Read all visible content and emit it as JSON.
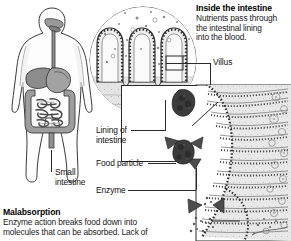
{
  "figure": {
    "width": 291,
    "height": 241,
    "background": "#ffffff",
    "ink_color": "#2a2a2a",
    "organ_fill": "#9a9a9a",
    "particle_fill": "#3a3a3a",
    "enzyme_fill": "#555555",
    "tissue_fill": "#cfcfcf"
  },
  "headings": {
    "inside_intestine": "Inside the intestine",
    "malabsorption": "Malabsorption"
  },
  "paragraphs": {
    "inside_intestine_lines": [
      "Nutrients pass through",
      "the intestinal lining",
      "into the blood."
    ],
    "malabsorption_lines": [
      "Enzyme action breaks food down into",
      "molecules that can be absorbed. Lack of"
    ]
  },
  "labels": {
    "small_intestine_line1": "Small",
    "small_intestine_line2": "intestine",
    "villus": "Villus",
    "lining_of_line1": "Lining of",
    "lining_of_line2": "intestine",
    "food_particle": "Food particle",
    "enzyme": "Enzyme"
  },
  "illustrations": {
    "body_figure": "human-torso-digestive-system",
    "circle_inset": "intestinal-villi-cross-section",
    "detail_panel": "villus-surface-absorption-detail",
    "food_particles": 2,
    "enzyme_triangles_on_particle": 3,
    "free_enzyme_triangles": 2
  }
}
